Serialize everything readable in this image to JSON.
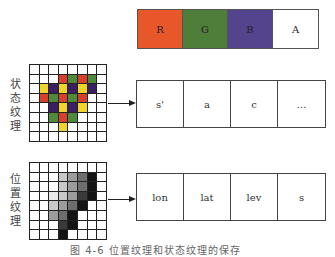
{
  "rgba_row": {
    "cells": [
      {
        "label": "R",
        "color": "#e8572a"
      },
      {
        "label": "G",
        "color": "#4f7d3a"
      },
      {
        "label": "B",
        "color": "#54448d"
      },
      {
        "label": "A",
        "color": "#ffffff"
      }
    ]
  },
  "state_texture": {
    "label": "状态纹理",
    "label_chars": [
      "状",
      "态",
      "纹",
      "理"
    ],
    "palette": {
      "R": "#d9402a",
      "G": "#4f8a3c",
      "P": "#3a1f66",
      "Y": "#f0d42a",
      "W": "#ffffff"
    },
    "rows": [
      "WWWWWWWW",
      "WWWRGRGW",
      "WYPYPYPW",
      "WRGRGRWW",
      "WWPYPYWW",
      "WWGRGWWW",
      "WWWYWWWW",
      "WWWWWWWW"
    ],
    "fields": [
      "s'",
      "a",
      "c",
      "…"
    ]
  },
  "position_texture": {
    "label": "位置纹理",
    "label_chars": [
      "位",
      "置",
      "纹",
      "理"
    ],
    "palette": {
      "0": "#ffffff",
      "1": "#e9e9e9",
      "2": "#c8c8c8",
      "3": "#9c9c9c",
      "4": "#6e6e6e",
      "5": "#3a3a3a",
      "6": "#141414"
    },
    "rows": [
      "00000000",
      "00023460",
      "00023460",
      "00123560",
      "00234600",
      "00346000",
      "00056000",
      "00060000"
    ],
    "fields": [
      "lon",
      "lat",
      "lev",
      "s"
    ]
  },
  "caption": "图 4-6  位置纹理和状态纹理的保存"
}
